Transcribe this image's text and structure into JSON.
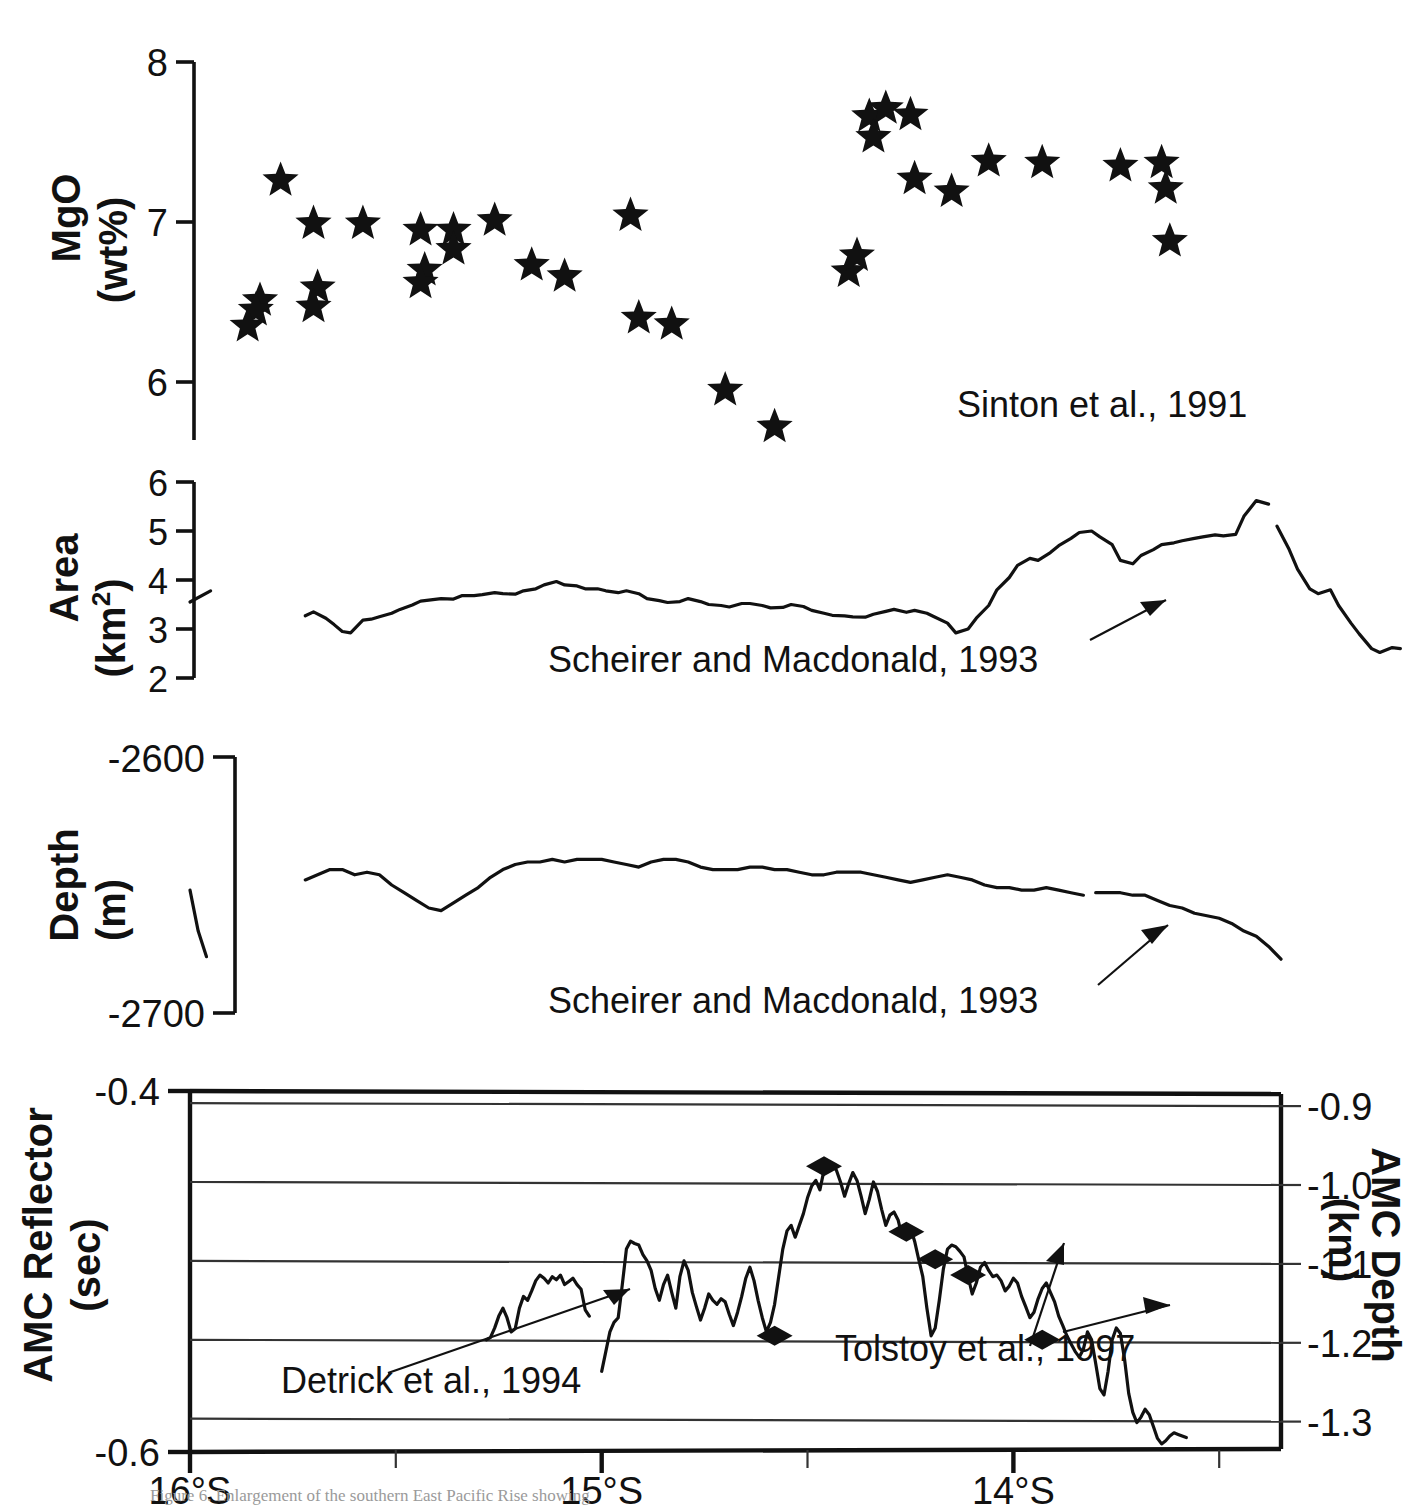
{
  "figure": {
    "caption": "Figure 6.  Enlargement of the southern East Pacific Rise showing",
    "x_axis": {
      "label_ticks": [
        "16°S",
        "15°S",
        "14°S"
      ],
      "tick_values": [
        16.0,
        15.0,
        14.0
      ],
      "minor_tick_values": [
        15.5,
        14.5,
        13.5
      ],
      "range_deg": [
        16.0,
        13.35
      ]
    }
  },
  "chart_data": [
    {
      "type": "scatter",
      "panel": "mgo",
      "title": "",
      "ylabel": "MgO (wt%)",
      "ylabel_line1": "MgO",
      "ylabel_line2": "(wt%)",
      "xlabel": "",
      "ylim": [
        5.6,
        8.0
      ],
      "yticks": [
        8,
        7,
        6
      ],
      "ytick_labels": [
        "8",
        "7",
        "6"
      ],
      "grid": false,
      "marker": "star",
      "annotation": "Sinton et al., 1991",
      "x": [
        15.78,
        15.83,
        15.84,
        15.86,
        15.7,
        15.69,
        15.7,
        15.58,
        15.44,
        15.43,
        15.44,
        15.36,
        15.36,
        15.26,
        15.17,
        15.09,
        14.93,
        14.91,
        14.83,
        14.7,
        14.58,
        14.4,
        14.38,
        14.35,
        14.34,
        14.31,
        14.25,
        14.24,
        14.15,
        14.06,
        13.93,
        13.74,
        13.64,
        13.63,
        13.62
      ],
      "y": [
        7.26,
        6.51,
        6.45,
        6.35,
        6.99,
        6.59,
        6.47,
        6.99,
        6.95,
        6.7,
        6.62,
        6.95,
        6.83,
        7.01,
        6.73,
        6.66,
        7.04,
        6.4,
        6.36,
        5.95,
        5.72,
        6.69,
        6.79,
        7.66,
        7.53,
        7.71,
        7.67,
        7.27,
        7.19,
        7.38,
        7.37,
        7.35,
        7.37,
        7.21,
        6.88
      ]
    },
    {
      "type": "line",
      "panel": "area",
      "ylabel": "Area (km2)",
      "ylabel_line1": "Area",
      "ylabel_line2": "(km2)",
      "ylim": [
        2,
        6
      ],
      "yticks": [
        6,
        5,
        4,
        3,
        2
      ],
      "ytick_labels": [
        "6",
        "5",
        "4",
        "3",
        "2"
      ],
      "grid": false,
      "annotation": "Scheirer and Macdonald, 1993",
      "units": "km^2",
      "segments": [
        {
          "x": [
            16.0,
            15.95
          ],
          "y": [
            3.55,
            3.78
          ]
        },
        {
          "x": [
            15.72,
            15.7,
            15.67,
            15.65,
            15.63,
            15.61,
            15.58,
            15.56,
            15.54,
            15.51,
            15.49,
            15.46,
            15.44,
            15.41,
            15.39,
            15.36,
            15.34,
            15.31,
            15.29,
            15.26,
            15.24,
            15.21,
            15.19,
            15.16,
            15.14,
            15.11,
            15.09,
            15.06,
            15.04,
            15.01,
            14.99,
            14.96,
            14.94,
            14.91,
            14.89,
            14.86,
            14.84,
            14.81,
            14.79,
            14.76,
            14.74,
            14.71,
            14.69,
            14.66,
            14.64,
            14.61,
            14.59,
            14.56,
            14.54,
            14.51,
            14.49,
            14.46,
            14.44,
            14.41,
            14.39,
            14.36,
            14.34,
            14.31,
            14.29,
            14.26,
            14.24,
            14.21,
            14.19,
            14.16,
            14.14,
            14.11,
            14.09,
            14.06,
            14.04,
            14.01,
            13.99,
            13.96,
            13.94,
            13.91,
            13.89,
            13.86,
            13.84,
            13.81,
            13.79,
            13.76,
            13.74,
            13.71,
            13.69,
            13.66,
            13.64,
            13.61,
            13.59,
            13.56,
            13.54,
            13.51,
            13.49,
            13.46,
            13.44,
            13.41,
            13.38
          ],
          "y": [
            3.27,
            3.35,
            3.22,
            3.09,
            2.95,
            2.92,
            3.18,
            3.2,
            3.25,
            3.32,
            3.4,
            3.49,
            3.57,
            3.6,
            3.62,
            3.61,
            3.68,
            3.68,
            3.7,
            3.74,
            3.72,
            3.71,
            3.78,
            3.82,
            3.9,
            3.97,
            3.9,
            3.88,
            3.82,
            3.82,
            3.78,
            3.74,
            3.78,
            3.72,
            3.62,
            3.58,
            3.54,
            3.56,
            3.62,
            3.56,
            3.5,
            3.48,
            3.45,
            3.52,
            3.52,
            3.48,
            3.43,
            3.44,
            3.5,
            3.46,
            3.38,
            3.32,
            3.28,
            3.27,
            3.25,
            3.24,
            3.3,
            3.36,
            3.4,
            3.34,
            3.38,
            3.32,
            3.24,
            3.12,
            2.92,
            3.0,
            3.22,
            3.48,
            3.8,
            4.05,
            4.3,
            4.44,
            4.4,
            4.56,
            4.7,
            4.85,
            4.97,
            5.0,
            4.88,
            4.72,
            4.4,
            4.33,
            4.5,
            4.62,
            4.72,
            4.76,
            4.8,
            4.85,
            4.88,
            4.92,
            4.9,
            4.93,
            5.3,
            5.62,
            5.55
          ]
        },
        {
          "x": [
            13.36,
            13.33,
            13.31,
            13.28,
            13.26,
            13.23,
            13.21,
            13.18,
            13.16,
            13.13,
            13.11,
            13.08,
            13.06
          ],
          "y": [
            5.1,
            4.62,
            4.22,
            3.82,
            3.72,
            3.8,
            3.48,
            3.12,
            2.9,
            2.6,
            2.52,
            2.62,
            2.6
          ]
        }
      ]
    },
    {
      "type": "line",
      "panel": "depth",
      "ylabel": "Depth (m)",
      "ylabel_line1": "Depth",
      "ylabel_line2": "(m)",
      "ylim": [
        -2700,
        -2600
      ],
      "yticks": [
        -2600,
        -2700
      ],
      "ytick_labels": [
        "-2600",
        "-2700"
      ],
      "grid": false,
      "annotation": "Scheirer and Macdonald, 1993",
      "segments": [
        {
          "x": [
            16.0,
            15.98,
            15.96
          ],
          "y": [
            -2652,
            -2668,
            -2678
          ]
        },
        {
          "x": [
            15.72,
            15.69,
            15.66,
            15.63,
            15.6,
            15.57,
            15.54,
            15.51,
            15.48,
            15.45,
            15.42,
            15.39,
            15.36,
            15.33,
            15.3,
            15.27,
            15.24,
            15.21,
            15.18,
            15.15,
            15.12,
            15.09,
            15.06,
            15.03,
            15.0,
            14.97,
            14.94,
            14.91,
            14.88,
            14.85,
            14.82,
            14.79,
            14.76,
            14.73,
            14.7,
            14.67,
            14.64,
            14.61,
            14.58,
            14.55,
            14.52,
            14.49,
            14.46,
            14.43,
            14.4,
            14.37,
            14.34,
            14.31,
            14.28,
            14.25,
            14.22,
            14.19,
            14.16,
            14.13,
            14.1,
            14.07,
            14.04,
            14.01,
            13.98,
            13.95,
            13.92,
            13.89,
            13.86,
            13.83
          ],
          "y": [
            -2648,
            -2646,
            -2644,
            -2644,
            -2646,
            -2645,
            -2646,
            -2650,
            -2653,
            -2656,
            -2659,
            -2660,
            -2657,
            -2654,
            -2651,
            -2647,
            -2644,
            -2642,
            -2641,
            -2641,
            -2640,
            -2641,
            -2640,
            -2640,
            -2640,
            -2641,
            -2642,
            -2643,
            -2641,
            -2640,
            -2640,
            -2641,
            -2643,
            -2644,
            -2644,
            -2644,
            -2643,
            -2643,
            -2644,
            -2644,
            -2645,
            -2646,
            -2646,
            -2645,
            -2645,
            -2645,
            -2646,
            -2647,
            -2648,
            -2649,
            -2648,
            -2647,
            -2646,
            -2647,
            -2648,
            -2650,
            -2651,
            -2651,
            -2652,
            -2652,
            -2651,
            -2652,
            -2653,
            -2654
          ]
        },
        {
          "x": [
            13.8,
            13.77,
            13.74,
            13.71,
            13.68,
            13.65,
            13.62,
            13.59,
            13.56,
            13.53,
            13.5,
            13.47,
            13.44,
            13.41,
            13.38,
            13.35
          ],
          "y": [
            -2653,
            -2653,
            -2653,
            -2654,
            -2654,
            -2656,
            -2658,
            -2659,
            -2661,
            -2662,
            -2663,
            -2665,
            -2668,
            -2670,
            -2674,
            -2679
          ]
        }
      ]
    },
    {
      "type": "line",
      "panel": "amc",
      "ylabel_left": "AMC Reflector (sec)",
      "ylabel_left_line1": "AMC Reflector",
      "ylabel_left_line2": "(sec)",
      "ylabel_right": "AMC Depth (km)",
      "ylabel_right_line1": "AMC Depth",
      "ylabel_right_line2": "(km)",
      "ylim_left": [
        -0.6,
        -0.4
      ],
      "yticks_left": [
        -0.4,
        -0.6
      ],
      "ytick_labels_left": [
        "-0.4",
        "-0.6"
      ],
      "ylim_right": [
        -1.3423,
        -0.8846
      ],
      "yticks_right": [
        -0.9,
        -1.0,
        -1.1,
        -1.2,
        -1.3
      ],
      "ytick_labels_right": [
        "-0.9",
        "-1.0",
        "-1.1",
        "-1.2",
        "-1.3"
      ],
      "grid": true,
      "gridline_values_right": [
        -0.9,
        -1.0,
        -1.1,
        -1.2,
        -1.3
      ],
      "annotations": [
        "Detrick et al., 1994",
        "Tolstoy et al., 1997"
      ],
      "marker": "diamond",
      "segments": [
        {
          "x": [
            15.28,
            15.27,
            15.26,
            15.25,
            15.24,
            15.23,
            15.22,
            15.21,
            15.2,
            15.19,
            15.18,
            15.17,
            15.16,
            15.15,
            15.14,
            15.13,
            15.12,
            15.11,
            15.1,
            15.09,
            15.08,
            15.07,
            15.06,
            15.05,
            15.04,
            15.03
          ],
          "y": [
            -1.2,
            -1.197,
            -1.185,
            -1.17,
            -1.16,
            -1.172,
            -1.19,
            -1.186,
            -1.16,
            -1.145,
            -1.15,
            -1.138,
            -1.125,
            -1.118,
            -1.122,
            -1.128,
            -1.12,
            -1.124,
            -1.118,
            -1.13,
            -1.126,
            -1.122,
            -1.13,
            -1.136,
            -1.162,
            -1.17
          ]
        },
        {
          "x": [
            15.0,
            14.99,
            14.98,
            14.97,
            14.96,
            14.95,
            14.94,
            14.93,
            14.92,
            14.91,
            14.9,
            14.89,
            14.88,
            14.87,
            14.86,
            14.85,
            14.84,
            14.83,
            14.82,
            14.81,
            14.8,
            14.79,
            14.78,
            14.77,
            14.76,
            14.75,
            14.74,
            14.73,
            14.72,
            14.71,
            14.7,
            14.69,
            14.68,
            14.67,
            14.66,
            14.65,
            14.64,
            14.63,
            14.62,
            14.61,
            14.6,
            14.59,
            14.58,
            14.57,
            14.56,
            14.55,
            14.54,
            14.53,
            14.52,
            14.51,
            14.5,
            14.49,
            14.48,
            14.47,
            14.46,
            14.45,
            14.44,
            14.43,
            14.42,
            14.41,
            14.4,
            14.39,
            14.38,
            14.37,
            14.36,
            14.35,
            14.34,
            14.33,
            14.32,
            14.31,
            14.3,
            14.29,
            14.28,
            14.27,
            14.26,
            14.25,
            14.24,
            14.23,
            14.22,
            14.21,
            14.2,
            14.19,
            14.18,
            14.17,
            14.16,
            14.15,
            14.14,
            14.13,
            14.12,
            14.11,
            14.1,
            14.09,
            14.08,
            14.07,
            14.06,
            14.05,
            14.04,
            14.03,
            14.02,
            14.01,
            14.0,
            13.99,
            13.98,
            13.97,
            13.96,
            13.95,
            13.94,
            13.93,
            13.92,
            13.91,
            13.9,
            13.89,
            13.88,
            13.87,
            13.86,
            13.85,
            13.84,
            13.83,
            13.82,
            13.81,
            13.8,
            13.79,
            13.78,
            13.77,
            13.76,
            13.75,
            13.74,
            13.73,
            13.72,
            13.71,
            13.7,
            13.69,
            13.68,
            13.67,
            13.66,
            13.65,
            13.64,
            13.63,
            13.62,
            13.61,
            13.6,
            13.59,
            13.58,
            13.57,
            13.56,
            13.55
          ],
          "y": [
            -1.24,
            -1.215,
            -1.19,
            -1.178,
            -1.172,
            -1.13,
            -1.085,
            -1.075,
            -1.078,
            -1.08,
            -1.092,
            -1.1,
            -1.112,
            -1.135,
            -1.15,
            -1.13,
            -1.118,
            -1.14,
            -1.16,
            -1.12,
            -1.1,
            -1.112,
            -1.14,
            -1.158,
            -1.175,
            -1.16,
            -1.142,
            -1.15,
            -1.155,
            -1.148,
            -1.152,
            -1.168,
            -1.182,
            -1.165,
            -1.145,
            -1.122,
            -1.108,
            -1.125,
            -1.15,
            -1.172,
            -1.19,
            -1.178,
            -1.155,
            -1.12,
            -1.085,
            -1.062,
            -1.055,
            -1.07,
            -1.055,
            -1.04,
            -1.02,
            -1.005,
            -0.998,
            -1.01,
            -0.985,
            -0.975,
            -0.978,
            -0.985,
            -1.0,
            -1.018,
            -1.002,
            -0.988,
            -0.998,
            -1.018,
            -1.04,
            -1.022,
            -1.0,
            -1.012,
            -1.035,
            -1.055,
            -1.042,
            -1.038,
            -1.048,
            -1.07,
            -1.062,
            -1.058,
            -1.075,
            -1.098,
            -1.12,
            -1.16,
            -1.195,
            -1.185,
            -1.15,
            -1.11,
            -1.085,
            -1.08,
            -1.082,
            -1.088,
            -1.095,
            -1.12,
            -1.142,
            -1.128,
            -1.108,
            -1.102,
            -1.112,
            -1.12,
            -1.118,
            -1.125,
            -1.138,
            -1.132,
            -1.122,
            -1.128,
            -1.145,
            -1.158,
            -1.172,
            -1.165,
            -1.148,
            -1.135,
            -1.128,
            -1.14,
            -1.152,
            -1.17,
            -1.182,
            -1.195,
            -1.205,
            -1.215,
            -1.222,
            -1.212,
            -1.19,
            -1.2,
            -1.23,
            -1.262,
            -1.27,
            -1.24,
            -1.2,
            -1.185,
            -1.192,
            -1.225,
            -1.268,
            -1.292,
            -1.305,
            -1.298,
            -1.288,
            -1.295,
            -1.31,
            -1.325,
            -1.332,
            -1.328,
            -1.322,
            -1.318,
            -1.32,
            -1.322,
            -1.324
          ]
        }
      ],
      "markers": [
        {
          "x": 14.58,
          "y": -1.195
        },
        {
          "x": 14.46,
          "y": -0.98
        },
        {
          "x": 14.26,
          "y": -1.063
        },
        {
          "x": 14.19,
          "y": -1.098
        },
        {
          "x": 14.11,
          "y": -1.118
        },
        {
          "x": 13.93,
          "y": -1.2
        }
      ]
    }
  ]
}
